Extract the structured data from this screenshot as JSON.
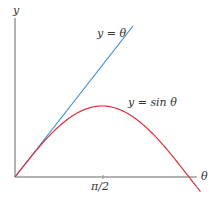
{
  "chart_data": {
    "type": "line",
    "title": "",
    "xlabel": "θ",
    "ylabel": "y",
    "x_ticks": [
      "π/2"
    ],
    "grid": false,
    "legend": "inline labels",
    "series": [
      {
        "name": "y = θ",
        "color": "#3a8fd8",
        "x": [
          0,
          2.07
        ],
        "y": [
          0,
          2.07
        ]
      },
      {
        "name": "y = sin θ",
        "color": "#d9303a",
        "x": [
          0,
          0.3927,
          0.7854,
          1.1781,
          1.5708,
          1.9635,
          2.3562,
          2.7489,
          3.1416,
          3.35
        ],
        "y": [
          0,
          0.383,
          0.707,
          0.924,
          1.0,
          0.924,
          0.707,
          0.383,
          0,
          -0.207
        ]
      }
    ],
    "xlim": [
      0,
      3.4
    ],
    "ylim": [
      -0.2,
      2.2
    ]
  },
  "labels": {
    "y_axis": "y",
    "x_axis": "θ",
    "tick_pi_half": "π/2",
    "line_label": "y = θ",
    "sine_label": "y = sin θ"
  },
  "colors": {
    "line": "#3a8fd8",
    "sine": "#d9303a",
    "axis": "#666666"
  }
}
